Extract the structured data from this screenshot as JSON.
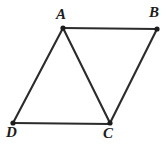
{
  "figure": {
    "kind": "geometry-diagram",
    "background_color": "#ffffff",
    "line_color": "#2b2b2b",
    "vertex_color": "#1c1c1c",
    "label_color": "#1c1c1c",
    "vertices": [
      {
        "id": "A",
        "label": "A",
        "x": 63,
        "y": 28,
        "label_x": 56,
        "label_y": 7
      },
      {
        "id": "B",
        "label": "B",
        "x": 157,
        "y": 29,
        "label_x": 149,
        "label_y": 5
      },
      {
        "id": "C",
        "label": "C",
        "x": 110,
        "y": 123,
        "label_x": 103,
        "label_y": 126
      },
      {
        "id": "D",
        "label": "D",
        "x": 13,
        "y": 123,
        "label_x": 6,
        "label_y": 125
      }
    ],
    "edges": [
      {
        "id": "AB",
        "from": "A",
        "to": "B",
        "x1": 63,
        "y1": 28,
        "x2": 157,
        "y2": 29
      },
      {
        "id": "BC",
        "from": "B",
        "to": "C",
        "x1": 157,
        "y1": 29,
        "x2": 110,
        "y2": 123
      },
      {
        "id": "DC",
        "from": "D",
        "to": "C",
        "x1": 13,
        "y1": 123,
        "x2": 110,
        "y2": 124
      },
      {
        "id": "AD",
        "from": "A",
        "to": "D",
        "x1": 63,
        "y1": 28,
        "x2": 13,
        "y2": 123
      },
      {
        "id": "AC",
        "from": "A",
        "to": "C",
        "x1": 63,
        "y1": 28,
        "x2": 110,
        "y2": 123
      }
    ]
  }
}
